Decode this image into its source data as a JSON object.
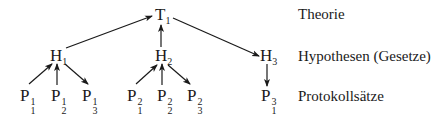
{
  "theory": {
    "letter": "T",
    "index": "1"
  },
  "hypotheses": [
    {
      "letter": "H",
      "index": "1"
    },
    {
      "letter": "H",
      "index": "2"
    },
    {
      "letter": "H",
      "index": "3"
    }
  ],
  "protocols": [
    {
      "letter": "P",
      "sup": "1",
      "sub": "1"
    },
    {
      "letter": "P",
      "sup": "1",
      "sub": "2"
    },
    {
      "letter": "P",
      "sup": "1",
      "sub": "3"
    },
    {
      "letter": "P",
      "sup": "2",
      "sub": "1"
    },
    {
      "letter": "P",
      "sup": "2",
      "sub": "2"
    },
    {
      "letter": "P",
      "sup": "2",
      "sub": "3"
    },
    {
      "letter": "P",
      "sup": "3",
      "sub": "1"
    }
  ],
  "labels": {
    "theory": "Theorie",
    "hypotheses": "Hypothesen (Gesetze)",
    "protocols": "Protokollsätze"
  },
  "edges": [
    {
      "from": "H1",
      "to": "T1"
    },
    {
      "from": "H2",
      "to": "T1"
    },
    {
      "from": "T1",
      "to": "H3"
    },
    {
      "from": "P1^1",
      "to": "H1"
    },
    {
      "from": "P2^1",
      "to": "H1"
    },
    {
      "from": "H1",
      "to": "P3^1"
    },
    {
      "from": "P1^2",
      "to": "H2"
    },
    {
      "from": "P2^2",
      "to": "H2"
    },
    {
      "from": "H2",
      "to": "P3^2"
    },
    {
      "from": "H3",
      "to": "P1^3"
    }
  ]
}
